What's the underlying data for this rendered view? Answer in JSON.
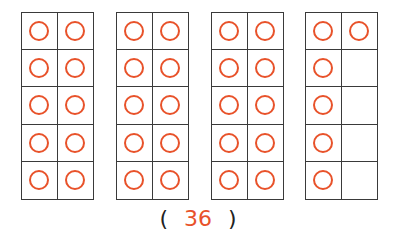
{
  "frames": [
    {
      "left": 21,
      "filled": [
        true,
        true,
        true,
        true,
        true,
        true,
        true,
        true,
        true,
        true
      ]
    },
    {
      "left": 116,
      "filled": [
        true,
        true,
        true,
        true,
        true,
        true,
        true,
        true,
        true,
        true
      ]
    },
    {
      "left": 211,
      "filled": [
        true,
        true,
        true,
        true,
        true,
        true,
        true,
        true,
        true,
        true
      ]
    },
    {
      "left": 305,
      "filled": [
        true,
        true,
        true,
        false,
        true,
        false,
        true,
        false,
        true,
        false
      ]
    }
  ],
  "answer": {
    "open_paren": "(",
    "value": "36",
    "close_paren": ")"
  },
  "colors": {
    "circle": "#e8522a",
    "grid": "#3a3a3a",
    "answer": "#e8522a"
  },
  "icons": {
    "counter": "circle-icon"
  }
}
